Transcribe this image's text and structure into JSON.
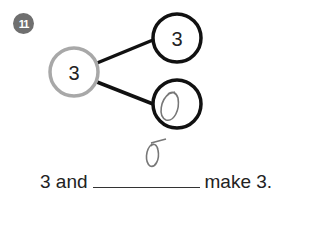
{
  "question": {
    "number": "11",
    "badge_color": "#6f6f6f"
  },
  "number_bond": {
    "whole": "3",
    "part_top": "3",
    "part_bottom_handwritten": "0",
    "whole_circle_color": "#a8a8a8",
    "part_circle_color": "#111111"
  },
  "handwritten_answer": "0",
  "sentence": {
    "before": "3 and",
    "after": "make 3."
  }
}
